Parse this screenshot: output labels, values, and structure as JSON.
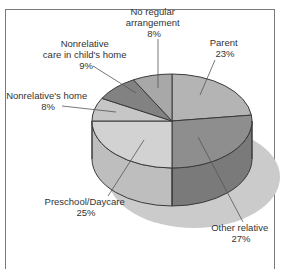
{
  "chart_data": {
    "type": "pie",
    "style": "3d",
    "title": "",
    "categories": [
      "Parent",
      "Other relative",
      "Preschool/Daycare",
      "Nonrelative's home",
      "Nonrelative care in child's home",
      "No regular arrangement"
    ],
    "values": [
      23,
      27,
      25,
      8,
      9,
      8
    ],
    "unit": "%",
    "labels": [
      {
        "lines": [
          "Parent",
          "23%"
        ]
      },
      {
        "lines": [
          "Other relative",
          "27%"
        ]
      },
      {
        "lines": [
          "Preschool/Daycare",
          "25%"
        ]
      },
      {
        "lines": [
          "Nonrelative's home",
          "8%"
        ]
      },
      {
        "lines": [
          "Nonrelative",
          "care in child's home",
          "9%"
        ]
      },
      {
        "lines": [
          "No regular",
          "arrangement",
          "8%"
        ]
      }
    ],
    "colors": [
      "#b4b4b4",
      "#8e8e8e",
      "#d2d2d2",
      "#c6c6c6",
      "#828282",
      "#a8a8a8"
    ],
    "side_colors": [
      "#a2a2a2",
      "#7a7a7a",
      "#bebebe",
      "#b2b2b2",
      "#727272",
      "#969696"
    ],
    "shadow_color": "#cbcbcb",
    "outline_color": "#3a3a3a",
    "legend": "none (leader-line labels)"
  }
}
